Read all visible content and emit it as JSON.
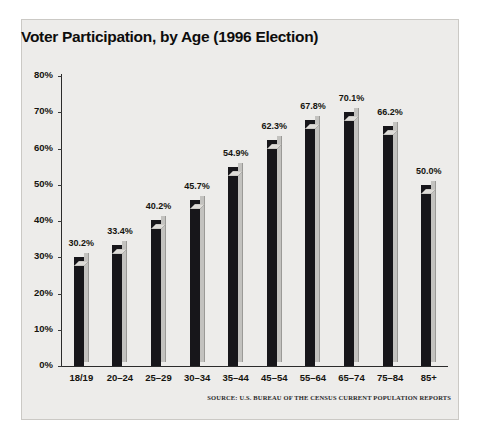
{
  "chart_data": {
    "type": "bar",
    "title": "Voter Participation, by Age (1996 Election)",
    "xlabel": "",
    "ylabel": "",
    "ylim": [
      0,
      80
    ],
    "ytick_labels": [
      "0%",
      "10%",
      "20%",
      "30%",
      "40%",
      "50%",
      "60%",
      "70%",
      "80%"
    ],
    "ytick_values": [
      0,
      10,
      20,
      30,
      40,
      50,
      60,
      70,
      80
    ],
    "categories": [
      "18/19",
      "20–24",
      "25–29",
      "30–34",
      "35–44",
      "45–54",
      "55–64",
      "65–74",
      "75–84",
      "85+"
    ],
    "values": [
      30.2,
      33.4,
      40.2,
      45.7,
      54.9,
      62.3,
      67.8,
      70.1,
      66.2,
      50.0
    ],
    "value_labels": [
      "30.2%",
      "33.4%",
      "40.2%",
      "45.7%",
      "54.9%",
      "62.3%",
      "67.8%",
      "70.1%",
      "66.2%",
      "50.0%"
    ],
    "grid": false,
    "legend": null,
    "style": "3d-bars",
    "colors": {
      "bar_front": "#17161a",
      "bar_side": "#c3c2bf",
      "bar_top": "#dedcd8",
      "panel_background": "#edecea",
      "axis": "#2b2b2b",
      "text": "#15140f",
      "figure_background": "#ffffff"
    }
  },
  "source_note": "SOURCE: U.S. BUREAU OF THE CENSUS CURRENT POPULATION REPORTS"
}
